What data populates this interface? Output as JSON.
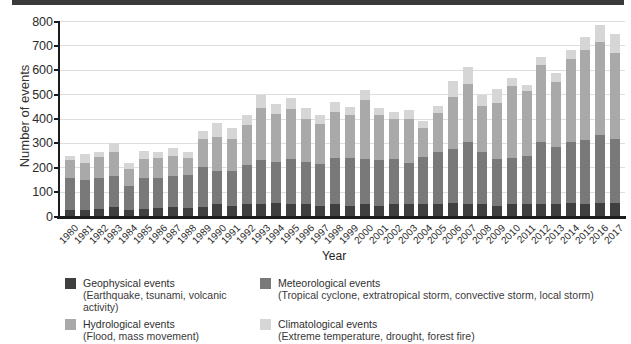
{
  "decor": {
    "top_bar_color": "#3a3a3a"
  },
  "chart_data": {
    "type": "bar",
    "stacked": true,
    "title": "",
    "xlabel": "Year",
    "ylabel": "Number of events",
    "ylim": [
      0,
      800
    ],
    "yticks": [
      0,
      100,
      200,
      300,
      400,
      500,
      600,
      700,
      800
    ],
    "grid": "horizontal",
    "legend_position": "bottom",
    "categories": [
      "1980",
      "1981",
      "1982",
      "1983",
      "1984",
      "1985",
      "1986",
      "1987",
      "1988",
      "1989",
      "1990",
      "1991",
      "1992",
      "1993",
      "1994",
      "1995",
      "1996",
      "1997",
      "1998",
      "1999",
      "2000",
      "2001",
      "2002",
      "2003",
      "2004",
      "2005",
      "2006",
      "2007",
      "2008",
      "2009",
      "2010",
      "2011",
      "2012",
      "2013",
      "2014",
      "2015",
      "2016",
      "2017"
    ],
    "series": [
      {
        "name": "Geophysical events",
        "desc": "(Earthquake, tsunami, volcanic activity)",
        "color": "#3f3f3f",
        "values": [
          25,
          25,
          30,
          40,
          25,
          30,
          35,
          40,
          35,
          40,
          50,
          45,
          50,
          50,
          55,
          50,
          50,
          45,
          50,
          45,
          50,
          45,
          50,
          50,
          50,
          50,
          55,
          50,
          50,
          45,
          50,
          50,
          50,
          50,
          55,
          50,
          55,
          55
        ]
      },
      {
        "name": "Meteorological events",
        "desc": "(Tropical cyclone, extratropical storm, convective storm, local storm)",
        "color": "#797979",
        "values": [
          135,
          125,
          130,
          125,
          100,
          130,
          125,
          125,
          135,
          165,
          135,
          140,
          160,
          180,
          170,
          185,
          175,
          170,
          190,
          195,
          185,
          185,
          185,
          170,
          195,
          215,
          220,
          255,
          215,
          190,
          190,
          200,
          255,
          235,
          250,
          265,
          280,
          265
        ]
      },
      {
        "name": "Hydrological events",
        "desc": "(Flood, mass movement)",
        "color": "#a9a9a9",
        "values": [
          70,
          70,
          85,
          100,
          70,
          75,
          80,
          85,
          70,
          115,
          140,
          135,
          165,
          215,
          195,
          205,
          175,
          165,
          190,
          175,
          245,
          185,
          165,
          180,
          120,
          160,
          215,
          240,
          190,
          230,
          295,
          265,
          315,
          265,
          340,
          370,
          380,
          350
        ]
      },
      {
        "name": "Climatological events",
        "desc": "(Extreme temperature, drought, forest fire)",
        "color": "#d6d6d6",
        "values": [
          20,
          35,
          20,
          35,
          25,
          35,
          25,
          30,
          25,
          30,
          60,
          45,
          40,
          55,
          40,
          45,
          45,
          35,
          40,
          35,
          40,
          30,
          30,
          35,
          25,
          30,
          65,
          70,
          45,
          60,
          35,
          25,
          35,
          40,
          40,
          50,
          70,
          80
        ]
      }
    ],
    "totals": [
      250,
      255,
      265,
      300,
      220,
      270,
      265,
      280,
      265,
      350,
      385,
      365,
      415,
      500,
      460,
      485,
      445,
      415,
      470,
      450,
      520,
      445,
      430,
      435,
      390,
      455,
      555,
      615,
      500,
      525,
      570,
      540,
      655,
      590,
      685,
      735,
      785,
      750
    ]
  }
}
